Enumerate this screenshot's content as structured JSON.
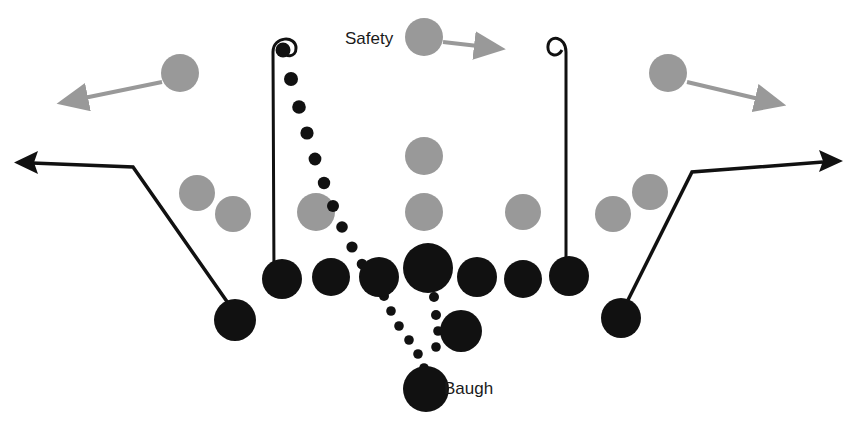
{
  "diagram": {
    "colors": {
      "offense": "#111111",
      "defense": "#999999",
      "route": "#111111",
      "pass": "#111111",
      "background": "#ffffff"
    },
    "labels": [
      {
        "name": "safety-label",
        "text": "Safety",
        "x": 345,
        "y": 40
      },
      {
        "name": "baugh-label",
        "text": "Baugh",
        "x": 444,
        "y": 390
      }
    ],
    "offense_players": [
      {
        "name": "left-end",
        "cx": 282,
        "cy": 279,
        "r": 20
      },
      {
        "name": "left-tackle",
        "cx": 331,
        "cy": 277,
        "r": 19
      },
      {
        "name": "left-guard",
        "cx": 379,
        "cy": 277,
        "r": 20
      },
      {
        "name": "center",
        "cx": 428,
        "cy": 268,
        "r": 25
      },
      {
        "name": "right-guard",
        "cx": 477,
        "cy": 277,
        "r": 20
      },
      {
        "name": "right-tackle",
        "cx": 523,
        "cy": 279,
        "r": 19
      },
      {
        "name": "right-end",
        "cx": 569,
        "cy": 276,
        "r": 20
      },
      {
        "name": "left-halfback",
        "cx": 235,
        "cy": 320,
        "r": 21
      },
      {
        "name": "right-halfback",
        "cx": 621,
        "cy": 318,
        "r": 20
      },
      {
        "name": "fullback",
        "cx": 461,
        "cy": 331,
        "r": 21
      },
      {
        "name": "tailback-baugh",
        "cx": 426,
        "cy": 389,
        "r": 23
      }
    ],
    "defense_players": [
      {
        "name": "safety",
        "cx": 424,
        "cy": 37,
        "r": 19
      },
      {
        "name": "left-defensive-back",
        "cx": 180,
        "cy": 73,
        "r": 19
      },
      {
        "name": "right-defensive-back",
        "cx": 668,
        "cy": 73,
        "r": 19
      },
      {
        "name": "left-outer-linebacker",
        "cx": 197,
        "cy": 193,
        "r": 18
      },
      {
        "name": "left-inner-linebacker",
        "cx": 233,
        "cy": 214,
        "r": 18
      },
      {
        "name": "left-line-tackle",
        "cx": 316,
        "cy": 212,
        "r": 19
      },
      {
        "name": "middle-high-lineman",
        "cx": 424,
        "cy": 156,
        "r": 19
      },
      {
        "name": "middle-low-lineman",
        "cx": 424,
        "cy": 212,
        "r": 19
      },
      {
        "name": "right-line-tackle",
        "cx": 523,
        "cy": 212,
        "r": 18
      },
      {
        "name": "right-inner-linebacker",
        "cx": 613,
        "cy": 214,
        "r": 18
      },
      {
        "name": "right-outer-linebacker",
        "cx": 650,
        "cy": 192,
        "r": 18
      }
    ],
    "defense_motion_arrows": [
      {
        "name": "safety-motion-arrow",
        "x1": 443,
        "y1": 42,
        "x2": 486,
        "y2": 47
      },
      {
        "name": "left-db-motion-arrow",
        "x1": 162,
        "y1": 82,
        "x2": 76,
        "y2": 100
      },
      {
        "name": "right-db-motion-arrow",
        "x1": 687,
        "y1": 82,
        "x2": 767,
        "y2": 102
      }
    ],
    "routes": [
      {
        "name": "left-end-hook-route",
        "path": "M 274 279 L 273 52 C 273 36 296 35 296 48 C 296 58 285 58 282 50"
      },
      {
        "name": "right-end-hook-route",
        "path": "M 566 276 L 566 52 C 566 36 549 34 548 46 C 547 56 558 58 562 50"
      },
      {
        "name": "left-halfback-out-route",
        "path": "M 228 303 L 133 167 L 32 163",
        "arrow": {
          "tip_x": 14,
          "tip_y": 163,
          "dir": "left"
        }
      },
      {
        "name": "right-halfback-out-route",
        "path": "M 628 300 L 692 172 L 823 162",
        "arrow": {
          "tip_x": 843,
          "tip_y": 161,
          "dir": "right"
        }
      }
    ],
    "pass_route": {
      "name": "baugh-pass-trajectory",
      "description": "dotted pass line from Baugh through the line to the left end hook",
      "dots": [
        {
          "cx": 283,
          "cy": 50,
          "r": 7.5
        },
        {
          "cx": 291,
          "cy": 79,
          "r": 7.0
        },
        {
          "cx": 299,
          "cy": 107,
          "r": 6.8
        },
        {
          "cx": 307,
          "cy": 133,
          "r": 6.6
        },
        {
          "cx": 315,
          "cy": 159,
          "r": 6.4
        },
        {
          "cx": 324,
          "cy": 183,
          "r": 6.2
        },
        {
          "cx": 333,
          "cy": 206,
          "r": 6.0
        },
        {
          "cx": 342,
          "cy": 227,
          "r": 5.8
        },
        {
          "cx": 352,
          "cy": 247,
          "r": 5.6
        },
        {
          "cx": 362,
          "cy": 264,
          "r": 5.3
        },
        {
          "cx": 372,
          "cy": 279,
          "r": 5.0
        },
        {
          "cx": 384,
          "cy": 296,
          "r": 5.0
        },
        {
          "cx": 391,
          "cy": 311,
          "r": 4.8
        },
        {
          "cx": 399,
          "cy": 326,
          "r": 4.8
        },
        {
          "cx": 409,
          "cy": 340,
          "r": 4.8
        },
        {
          "cx": 418,
          "cy": 354,
          "r": 4.8
        },
        {
          "cx": 424,
          "cy": 368,
          "r": 4.8
        }
      ],
      "branch_dots": [
        {
          "cx": 434,
          "cy": 297,
          "r": 5.0
        },
        {
          "cx": 436,
          "cy": 315,
          "r": 5.0
        },
        {
          "cx": 438,
          "cy": 331,
          "r": 4.8
        },
        {
          "cx": 436,
          "cy": 347,
          "r": 4.8
        }
      ]
    }
  }
}
